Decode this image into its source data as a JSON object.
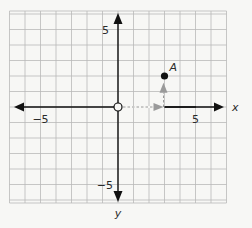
{
  "diagram": {
    "type": "coordinate-plane",
    "grid": {
      "x_min": -7,
      "x_max": 7,
      "y_min": -6,
      "y_max": 6,
      "step": 1
    },
    "axes": {
      "x_label": "x",
      "y_label": "y",
      "x_tick_labels": [
        {
          "value": -5,
          "text": "−5"
        },
        {
          "value": 5,
          "text": "5"
        }
      ],
      "y_tick_labels": [
        {
          "value": 5,
          "text": "5"
        },
        {
          "value": -5,
          "text": "−5"
        }
      ]
    },
    "origin_marker": "open-circle",
    "points": [
      {
        "label": "A",
        "x": 3,
        "y": 2
      }
    ],
    "path_arrows": [
      {
        "from": [
          0,
          0
        ],
        "to": [
          3,
          0
        ],
        "style": "dashed",
        "color": "#9a9a9a"
      },
      {
        "from": [
          3,
          0
        ],
        "to": [
          3,
          1.5
        ],
        "style": "dashed",
        "color": "#9a9a9a"
      }
    ],
    "colors": {
      "grid": "#b9b9b9",
      "axis": "#111111",
      "point": "#111111",
      "path": "#9a9a9a"
    }
  }
}
